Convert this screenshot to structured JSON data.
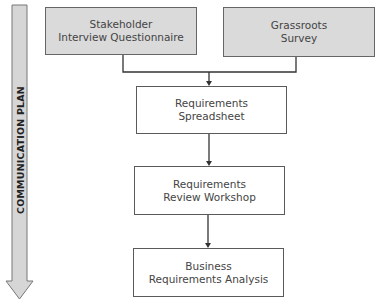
{
  "communication_plan": {
    "label": "COMMUNICATION PLAN",
    "arrow_direction": "down"
  },
  "boxes": [
    {
      "id": "stakeholder-questionnaire",
      "line1": "Stakeholder",
      "line2": "Interview Questionnaire",
      "fill": "#dadada"
    },
    {
      "id": "grassroots-survey",
      "line1": "Grassroots",
      "line2": "Survey",
      "fill": "#dadada"
    },
    {
      "id": "requirements-spreadsheet",
      "line1": "Requirements",
      "line2": "Spreadsheet",
      "fill": "#ffffff"
    },
    {
      "id": "requirements-review-workshop",
      "line1": "Requirements",
      "line2": "Review Workshop",
      "fill": "#ffffff"
    },
    {
      "id": "business-requirements-analysis",
      "line1": "Business",
      "line2": "Requirements Analysis",
      "fill": "#ffffff"
    }
  ],
  "connections": [
    {
      "from": [
        "stakeholder-questionnaire",
        "grassroots-survey"
      ],
      "to": "requirements-spreadsheet"
    },
    {
      "from": "requirements-spreadsheet",
      "to": "requirements-review-workshop"
    },
    {
      "from": "requirements-review-workshop",
      "to": "business-requirements-analysis"
    }
  ]
}
